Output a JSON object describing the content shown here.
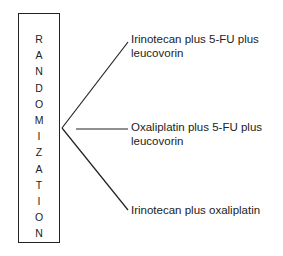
{
  "box": {
    "letters": [
      "R",
      "A",
      "N",
      "D",
      "O",
      "M",
      "I",
      "Z",
      "A",
      "T",
      "I",
      "O",
      "N"
    ],
    "word": "RANDOMIZATION"
  },
  "arms": [
    {
      "line1": "Irinotecan plus 5-FU plus",
      "line2": "leucovorin"
    },
    {
      "line1": "Oxaliplatin plus 5-FU plus",
      "line2": "leucovorin"
    },
    {
      "line1": "Irinotecan plus oxaliplatin",
      "line2": ""
    }
  ]
}
